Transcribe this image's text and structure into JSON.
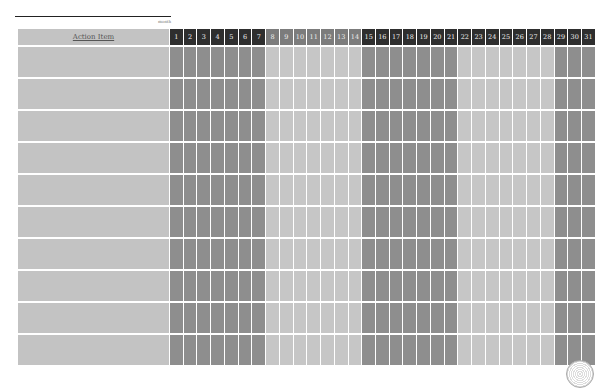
{
  "header": {
    "month_label": "month"
  },
  "table": {
    "action_header": "Action Item",
    "days": [
      "1",
      "2",
      "3",
      "4",
      "5",
      "6",
      "7",
      "8",
      "9",
      "10",
      "11",
      "12",
      "13",
      "14",
      "15",
      "16",
      "17",
      "18",
      "19",
      "20",
      "21",
      "22",
      "23",
      "24",
      "25",
      "26",
      "27",
      "28",
      "29",
      "30",
      "31"
    ],
    "row_count": 10,
    "rows": [
      "",
      "",
      "",
      "",
      "",
      "",
      "",
      "",
      "",
      ""
    ]
  },
  "colors": {
    "header_dark": "#2e2e2e",
    "header_mid": "#7c7c7c",
    "body_dark": "#8e8e8e",
    "body_light": "#c6c6c6",
    "action_cell": "#c3c3c3"
  },
  "logo": {
    "icon": "seal-logo-icon"
  }
}
